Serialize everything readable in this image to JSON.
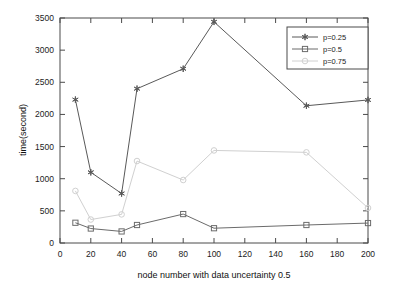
{
  "chart_data": {
    "type": "line",
    "title": "",
    "xlabel": "node number with data uncertainty 0.5",
    "ylabel": "time(second)",
    "xlim": [
      0,
      200
    ],
    "ylim": [
      0,
      3500
    ],
    "xticks": [
      0,
      20,
      40,
      60,
      80,
      100,
      120,
      140,
      160,
      180,
      200
    ],
    "yticks": [
      0,
      500,
      1000,
      1500,
      2000,
      2500,
      3000,
      3500
    ],
    "grid": false,
    "legend_position": "upper right",
    "x": [
      10,
      20,
      40,
      50,
      80,
      100,
      160,
      200
    ],
    "series": [
      {
        "name": "p=0.25",
        "marker": "star-marker",
        "color": "#595959",
        "values": [
          2230,
          1100,
          770,
          2400,
          2710,
          3440,
          2135,
          2225
        ]
      },
      {
        "name": "p=0.5",
        "marker": "square-marker",
        "color": "#6b6b6b",
        "values": [
          315,
          225,
          180,
          280,
          450,
          230,
          280,
          310
        ]
      },
      {
        "name": "p=0.75",
        "marker": "circle-marker",
        "color": "#d0d0d0",
        "values": [
          810,
          365,
          445,
          1275,
          980,
          1440,
          1410,
          545
        ]
      }
    ]
  },
  "legend": {
    "entries": [
      {
        "label": "p=0.25"
      },
      {
        "label": "p=0.5"
      },
      {
        "label": "p=0.75"
      }
    ]
  },
  "axis": {
    "x_label": "node number with data uncertainty 0.5",
    "y_label": "time(second)",
    "x_tick_labels": [
      "0",
      "20",
      "40",
      "60",
      "80",
      "100",
      "120",
      "140",
      "160",
      "180",
      "200"
    ],
    "y_tick_labels": [
      "0",
      "500",
      "1000",
      "1500",
      "2000",
      "2500",
      "3000",
      "3500"
    ]
  }
}
